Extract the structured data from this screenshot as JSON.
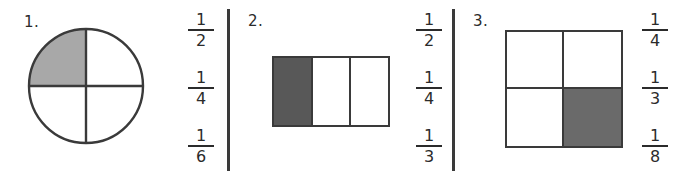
{
  "worksheet": {
    "background_color": "#ffffff",
    "ink_color": "#3a3a3a",
    "divider_color": "#3a3a3a"
  },
  "problems": [
    {
      "number_label": "1.",
      "figure": {
        "kind": "circle",
        "parts_total": 4,
        "parts_shaded": 1,
        "shaded_positions": [
          "upper-left"
        ],
        "shade_color": "#a8a8a8"
      },
      "choices": [
        {
          "numerator": "1",
          "denominator": "2"
        },
        {
          "numerator": "1",
          "denominator": "4"
        },
        {
          "numerator": "1",
          "denominator": "6"
        }
      ]
    },
    {
      "number_label": "2.",
      "figure": {
        "kind": "bar",
        "parts_total": 3,
        "parts_shaded": 1,
        "shaded_positions": [
          "left"
        ],
        "shade_color": "#585858"
      },
      "choices": [
        {
          "numerator": "1",
          "denominator": "2"
        },
        {
          "numerator": "1",
          "denominator": "4"
        },
        {
          "numerator": "1",
          "denominator": "3"
        }
      ]
    },
    {
      "number_label": "3.",
      "figure": {
        "kind": "square-grid",
        "parts_total": 4,
        "parts_shaded": 1,
        "shaded_positions": [
          "bottom-right"
        ],
        "shade_color": "#6a6a6a"
      },
      "choices": [
        {
          "numerator": "1",
          "denominator": "4"
        },
        {
          "numerator": "1",
          "denominator": "3"
        },
        {
          "numerator": "1",
          "denominator": "8"
        }
      ]
    }
  ]
}
